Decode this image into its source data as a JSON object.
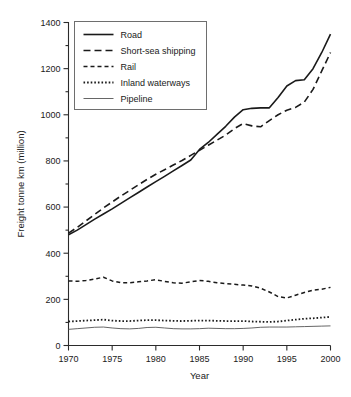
{
  "chart_data": {
    "type": "line",
    "title": "",
    "xlabel": "Year",
    "ylabel": "Freight tonne km (million)",
    "xlim": [
      1970,
      2000
    ],
    "ylim": [
      0,
      1400
    ],
    "ytick_step": 200,
    "yminor_step": 100,
    "xtick_step": 5,
    "xminor_step": 1,
    "grid": false,
    "legend_position": "top-left",
    "xticklabels": [
      "1970",
      "1975",
      "1980",
      "1985",
      "1990",
      "1995",
      "2000"
    ],
    "yticklabels": [
      "0",
      "200",
      "400",
      "600",
      "800",
      "1000",
      "1200",
      "1400"
    ],
    "x": [
      1970,
      1971,
      1972,
      1973,
      1974,
      1975,
      1976,
      1977,
      1978,
      1979,
      1980,
      1981,
      1982,
      1983,
      1984,
      1985,
      1986,
      1987,
      1988,
      1989,
      1990,
      1991,
      1992,
      1993,
      1994,
      1995,
      1996,
      1997,
      1998,
      1999,
      2000
    ],
    "series": [
      {
        "name": "Road",
        "style": "solid",
        "color": "#1a1a1a",
        "width": 1.6,
        "values": [
          480,
          500,
          524,
          548,
          570,
          592,
          616,
          640,
          663,
          687,
          710,
          733,
          757,
          780,
          804,
          850,
          880,
          915,
          950,
          990,
          1022,
          1028,
          1030,
          1030,
          1075,
          1125,
          1148,
          1152,
          1200,
          1270,
          1350
        ]
      },
      {
        "name": "Short-sea shipping",
        "style": "dashed-long",
        "color": "#1a1a1a",
        "width": 1.6,
        "values": [
          487,
          512,
          540,
          568,
          596,
          622,
          648,
          672,
          696,
          720,
          742,
          762,
          782,
          802,
          824,
          846,
          868,
          890,
          912,
          940,
          962,
          952,
          948,
          975,
          1000,
          1020,
          1032,
          1055,
          1110,
          1190,
          1270
        ]
      },
      {
        "name": "Rail",
        "style": "dashed-short",
        "color": "#1a1a1a",
        "width": 1.5,
        "values": [
          280,
          278,
          282,
          288,
          296,
          280,
          272,
          272,
          276,
          280,
          285,
          278,
          272,
          270,
          276,
          282,
          278,
          272,
          268,
          265,
          262,
          258,
          248,
          232,
          212,
          206,
          218,
          230,
          240,
          244,
          252
        ]
      },
      {
        "name": "Inland waterways",
        "style": "dotted",
        "color": "#1a1a1a",
        "width": 1.8,
        "values": [
          104,
          106,
          108,
          110,
          112,
          108,
          106,
          106,
          108,
          110,
          110,
          108,
          107,
          106,
          107,
          108,
          108,
          107,
          106,
          106,
          106,
          104,
          103,
          102,
          104,
          108,
          112,
          116,
          118,
          121,
          124
        ]
      },
      {
        "name": "Pipeline",
        "style": "thin-solid",
        "color": "#555555",
        "width": 0.9,
        "values": [
          70,
          73,
          76,
          79,
          80,
          76,
          73,
          72,
          74,
          78,
          79,
          76,
          73,
          72,
          72,
          73,
          75,
          74,
          73,
          73,
          74,
          76,
          79,
          80,
          80,
          80,
          81,
          82,
          83,
          84,
          85
        ]
      }
    ]
  }
}
